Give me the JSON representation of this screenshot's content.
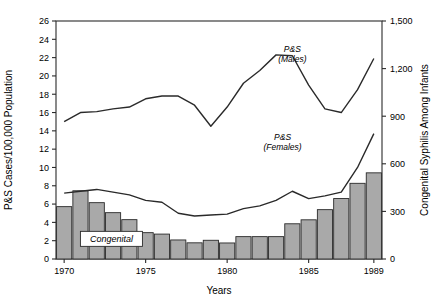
{
  "chart_data": {
    "type": "bar",
    "title": "",
    "xlabel": "Years",
    "ylabel": "P&S Cases/100,000 Population",
    "y2label": "Congenital Syphilis Among Infants",
    "x": [
      1970,
      1971,
      1972,
      1973,
      1974,
      1975,
      1976,
      1977,
      1978,
      1979,
      1980,
      1981,
      1982,
      1983,
      1984,
      1985,
      1986,
      1987,
      1988,
      1989
    ],
    "xlim": [
      1969.5,
      1989.5
    ],
    "ylim": [
      0,
      26
    ],
    "y2lim": [
      0,
      1500
    ],
    "xticks": [
      1970,
      1975,
      1980,
      1985,
      1989
    ],
    "xtick_labels": [
      "1970",
      "1975",
      "1980",
      "1985",
      "1989"
    ],
    "yticks": [
      0,
      2,
      4,
      6,
      8,
      10,
      12,
      14,
      16,
      18,
      20,
      22,
      24,
      26
    ],
    "ytick_labels": [
      "0",
      "2",
      "4",
      "6",
      "8",
      "10",
      "12",
      "14",
      "16",
      "18",
      "20",
      "22",
      "24",
      "26"
    ],
    "y2ticks": [
      0,
      300,
      600,
      900,
      1200,
      1500
    ],
    "y2tick_labels": [
      "0",
      "300",
      "600",
      "900",
      "1,200",
      "1,500"
    ],
    "grid": false,
    "legend_position": "inline-annotations",
    "series": [
      {
        "name": "Congenital",
        "type": "bar",
        "axis": "right",
        "label": "Congenital",
        "fill": "#a9a9a9",
        "stroke": "#2a2a2a",
        "values": [
          330,
          430,
          355,
          292,
          248,
          166,
          157,
          120,
          102,
          118,
          101,
          141,
          141,
          141,
          222,
          247,
          311,
          381,
          477,
          543
        ]
      },
      {
        "name": "P&S (Males)",
        "type": "line",
        "axis": "left",
        "label": "P&S\n(Males)",
        "label_line1": "P&S",
        "label_line2": "(Males)",
        "stroke": "#2a2a2a",
        "values": [
          15.0,
          16.0,
          16.1,
          16.4,
          16.6,
          17.5,
          17.8,
          17.8,
          16.8,
          14.5,
          16.6,
          19.2,
          20.6,
          22.3,
          22.2,
          19.0,
          16.4,
          16.0,
          18.5,
          21.9
        ]
      },
      {
        "name": "P&S (Females)",
        "type": "line",
        "axis": "left",
        "label": "P&S\n(Females)",
        "label_line1": "P&S",
        "label_line2": "(Females)",
        "stroke": "#2a2a2a",
        "values": [
          7.2,
          7.4,
          7.6,
          7.3,
          7.0,
          6.4,
          6.2,
          5.0,
          4.7,
          4.8,
          4.9,
          5.5,
          5.8,
          6.4,
          7.4,
          6.6,
          6.9,
          7.3,
          10.0,
          13.7
        ]
      }
    ],
    "annotations": [
      {
        "text": "P&S",
        "subtext": "(Males)",
        "x": 1984.0,
        "y": 22.6
      },
      {
        "text": "P&S",
        "subtext": "(Females)",
        "x": 1983.4,
        "y": 13.0
      },
      {
        "text": "Congenital",
        "x": 1972.9,
        "y": 2.2,
        "boxed": true
      }
    ],
    "colors": {
      "bar_fill": "#a9a9a9",
      "bar_stroke": "#2a2a2a",
      "line": "#2a2a2a",
      "axis": "#2a2a2a",
      "background": "#ffffff"
    }
  }
}
